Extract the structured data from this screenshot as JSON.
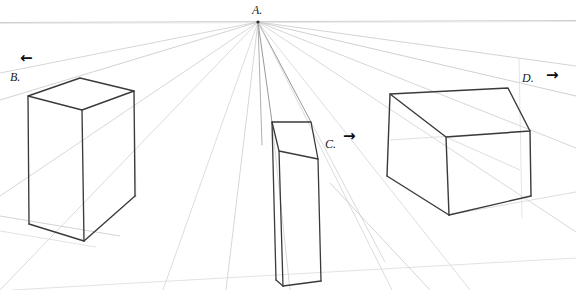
{
  "image": {
    "title": "One-point perspective box construction sketch",
    "medium": "pencil drawing",
    "width": 576,
    "height": 290,
    "background_color": "#ffffff"
  },
  "colors": {
    "ink_dark": "#333333",
    "ink_mid": "#555555",
    "construction_light": "#bdbdbd",
    "construction_faint": "#d8d8d8",
    "horizon": "#cccccc",
    "label_color": "#1a1a1a",
    "arrow_color": "#0d0d0d"
  },
  "labels": [
    {
      "id": "A",
      "text": "A.",
      "x": 252,
      "y": 4,
      "role": "vanishing-point-label"
    },
    {
      "id": "B",
      "text": "B.",
      "x": 10,
      "y": 71,
      "role": "box-label"
    },
    {
      "id": "C",
      "text": "C.",
      "x": 325,
      "y": 138,
      "role": "box-label"
    },
    {
      "id": "D",
      "text": "D.",
      "x": 522,
      "y": 72,
      "role": "box-label"
    }
  ],
  "arrows": [
    {
      "id": "arrow-b",
      "glyph": "←",
      "x": 20,
      "y": 51,
      "direction": "left",
      "for_label": "B"
    },
    {
      "id": "arrow-c",
      "glyph": "→",
      "x": 343,
      "y": 129,
      "direction": "right",
      "for_label": "C"
    },
    {
      "id": "arrow-d",
      "glyph": "→",
      "x": 546,
      "y": 68,
      "direction": "right",
      "for_label": "D"
    }
  ],
  "vanishing_point": {
    "label": "A",
    "x": 258,
    "y": 22
  },
  "horizon_line": {
    "y": 21.5,
    "x1": 0,
    "x2": 576
  },
  "boxes": [
    {
      "id": "B",
      "label": "B.",
      "description": "tall rectangular box, left of vanishing point, seen from above-left",
      "points": {
        "top_back_left": [
          28,
          96
        ],
        "top_back_right": [
          80,
          78
        ],
        "top_front_right": [
          134,
          91
        ],
        "top_front_left": [
          82,
          110
        ],
        "bottom_front_left": [
          84,
          241
        ],
        "bottom_back_left": [
          29,
          224
        ],
        "bottom_front_right": [
          135,
          196
        ]
      }
    },
    {
      "id": "C",
      "label": "C.",
      "description": "narrow tall box near center, just right of vanishing point axis",
      "points": {
        "top_back_left": [
          272,
          122
        ],
        "top_back_right": [
          311,
          122
        ],
        "top_front_right": [
          318,
          159
        ],
        "top_front_left": [
          279,
          151
        ],
        "bottom_front_left": [
          283,
          286
        ],
        "bottom_front_right": [
          321,
          281
        ],
        "bottom_back_left": [
          276,
          280
        ]
      }
    },
    {
      "id": "D",
      "label": "D.",
      "description": "wide flat box on the right, seen from above",
      "points": {
        "top_back_left": [
          390,
          94
        ],
        "top_back_right": [
          508,
          88
        ],
        "top_front_right": [
          530,
          131
        ],
        "top_front_left": [
          446,
          137
        ],
        "bottom_front_left": [
          449,
          215
        ],
        "bottom_back_left": [
          387,
          176
        ],
        "bottom_front_right": [
          531,
          196
        ]
      }
    }
  ],
  "construction_rays": {
    "origin_label": "A",
    "count": 14,
    "note": "light pencil guide lines radiating from vanishing point A"
  }
}
